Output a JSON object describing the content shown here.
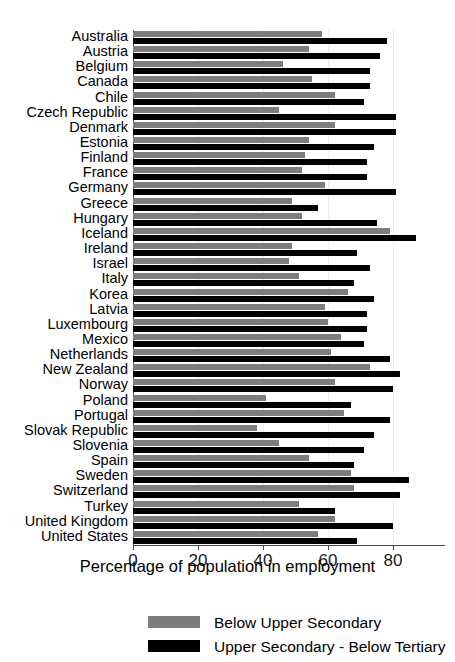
{
  "chart_data": {
    "type": "bar",
    "orientation": "horizontal",
    "title": "",
    "xlabel": "Percentage of population in employment",
    "ylabel": "",
    "xlim": [
      0,
      96
    ],
    "xticks": [
      0,
      20,
      40,
      60,
      80
    ],
    "grid": true,
    "legend_position": "bottom",
    "categories": [
      "Australia",
      "Austria",
      "Belgium",
      "Canada",
      "Chile",
      "Czech Republic",
      "Denmark",
      "Estonia",
      "Finland",
      "France",
      "Germany",
      "Greece",
      "Hungary",
      "Iceland",
      "Ireland",
      "Israel",
      "Italy",
      "Korea",
      "Latvia",
      "Luxembourg",
      "Mexico",
      "Netherlands",
      "New Zealand",
      "Norway",
      "Poland",
      "Portugal",
      "Slovak Republic",
      "Slovenia",
      "Spain",
      "Sweden",
      "Switzerland",
      "Turkey",
      "United Kingdom",
      "United States"
    ],
    "series": [
      {
        "name": "Below Upper Secondary",
        "color": "#7d7d7d",
        "values": [
          58,
          54,
          46,
          55,
          62,
          45,
          62,
          54,
          53,
          52,
          59,
          49,
          52,
          79,
          49,
          48,
          51,
          66,
          59,
          60,
          64,
          61,
          73,
          62,
          41,
          65,
          38,
          45,
          54,
          67,
          68,
          51,
          62,
          57
        ]
      },
      {
        "name": "Upper Secondary - Below Tertiary",
        "color": "#000000",
        "values": [
          78,
          76,
          73,
          73,
          71,
          81,
          81,
          74,
          72,
          72,
          81,
          57,
          75,
          87,
          69,
          73,
          68,
          74,
          72,
          72,
          71,
          79,
          82,
          80,
          67,
          79,
          74,
          71,
          68,
          85,
          82,
          62,
          80,
          69
        ]
      }
    ],
    "legend": [
      {
        "label": "Below Upper Secondary",
        "swatch": "below"
      },
      {
        "label": "Upper Secondary - Below Tertiary",
        "swatch": "upper"
      }
    ]
  }
}
